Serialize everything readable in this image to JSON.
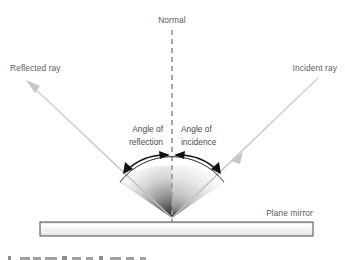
{
  "diagram": {
    "labels": {
      "normal": "Normal",
      "reflected_ray": "Reflected ray",
      "incident_ray": "Incident ray",
      "angle_of_reflection_line1": "Angle of",
      "angle_of_reflection_line2": "reflection",
      "angle_of_incidence_line1": "Angle of",
      "angle_of_incidence_line2": "incidence",
      "plane_mirror": "Plane mirror"
    },
    "colors": {
      "ray": "#c9c9c9",
      "normal_dashed": "#9a9a9a",
      "arc_arrow": "#101010",
      "mirror_border": "#6a6a6a",
      "mirror_fill": "#eeeeee",
      "label_text": "#5d5d5d",
      "cone_dark": "#3d3d3d",
      "background": "#ffffff"
    },
    "geometry": {
      "vertex_x": 172,
      "vertex_y": 218,
      "normal_top_y": 30,
      "mirror_left_x": 40,
      "mirror_right_x": 313,
      "mirror_top_y": 222,
      "mirror_height": 14,
      "incident_ray_start_x": 318,
      "incident_ray_start_y": 78,
      "reflected_ray_end_x": 26,
      "reflected_ray_end_y": 80
    }
  }
}
